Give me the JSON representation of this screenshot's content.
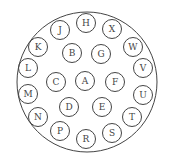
{
  "diagram": {
    "type": "connector-pinout",
    "outer": {
      "cx": 87,
      "cy": 82,
      "r": 70
    },
    "pin_radius": 9.5,
    "stroke_color": "#444444",
    "pins": [
      {
        "label": "H",
        "x": 86,
        "y": 23
      },
      {
        "label": "X",
        "x": 112,
        "y": 29
      },
      {
        "label": "W",
        "x": 133,
        "y": 47
      },
      {
        "label": "V",
        "x": 143,
        "y": 68
      },
      {
        "label": "U",
        "x": 143,
        "y": 95
      },
      {
        "label": "T",
        "x": 132,
        "y": 117
      },
      {
        "label": "S",
        "x": 112,
        "y": 133
      },
      {
        "label": "R",
        "x": 86,
        "y": 139
      },
      {
        "label": "P",
        "x": 60,
        "y": 131
      },
      {
        "label": "N",
        "x": 38,
        "y": 117
      },
      {
        "label": "M",
        "x": 28,
        "y": 94
      },
      {
        "label": "L",
        "x": 28,
        "y": 68
      },
      {
        "label": "K",
        "x": 38,
        "y": 47
      },
      {
        "label": "J",
        "x": 60,
        "y": 30
      },
      {
        "label": "B",
        "x": 72,
        "y": 53
      },
      {
        "label": "G",
        "x": 101,
        "y": 54
      },
      {
        "label": "C",
        "x": 56,
        "y": 82
      },
      {
        "label": "A",
        "x": 85,
        "y": 81
      },
      {
        "label": "F",
        "x": 115,
        "y": 82
      },
      {
        "label": "D",
        "x": 69,
        "y": 107
      },
      {
        "label": "E",
        "x": 102,
        "y": 107
      }
    ]
  }
}
